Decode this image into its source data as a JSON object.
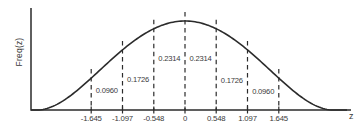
{
  "chart_data": {
    "type": "line",
    "title": "",
    "xlabel": "z",
    "ylabel": "Freq(z)",
    "x_ticks": [
      -1.645,
      -1.097,
      -0.548,
      0,
      0.548,
      1.097,
      1.645
    ],
    "x_tick_labels": [
      "-1.645",
      "-1.097",
      "-0.548",
      "0",
      "0.548",
      "1.097",
      "1.645"
    ],
    "dashed_lines_at_z": [
      -1.645,
      -1.097,
      -0.548,
      0,
      0.548,
      1.097,
      1.645
    ],
    "area_labels": [
      {
        "value": "0.0960",
        "between": [
          -1.645,
          -1.097
        ]
      },
      {
        "value": "0.1726",
        "between": [
          -1.097,
          -0.548
        ]
      },
      {
        "value": "0.2314",
        "between": [
          -0.548,
          0
        ]
      },
      {
        "value": "0.2314",
        "between": [
          0,
          0.548
        ]
      },
      {
        "value": "0.1726",
        "between": [
          0.548,
          1.097
        ]
      },
      {
        "value": "0.0960",
        "between": [
          1.097,
          1.645
        ]
      }
    ],
    "areas_numeric": [
      0.096,
      0.1726,
      0.2314,
      0.2314,
      0.1726,
      0.096
    ],
    "grid": false,
    "legend": false
  },
  "colors": {
    "ink": "#2e2e2e",
    "curve": "#2b2b2b",
    "background": "#ffffff"
  }
}
